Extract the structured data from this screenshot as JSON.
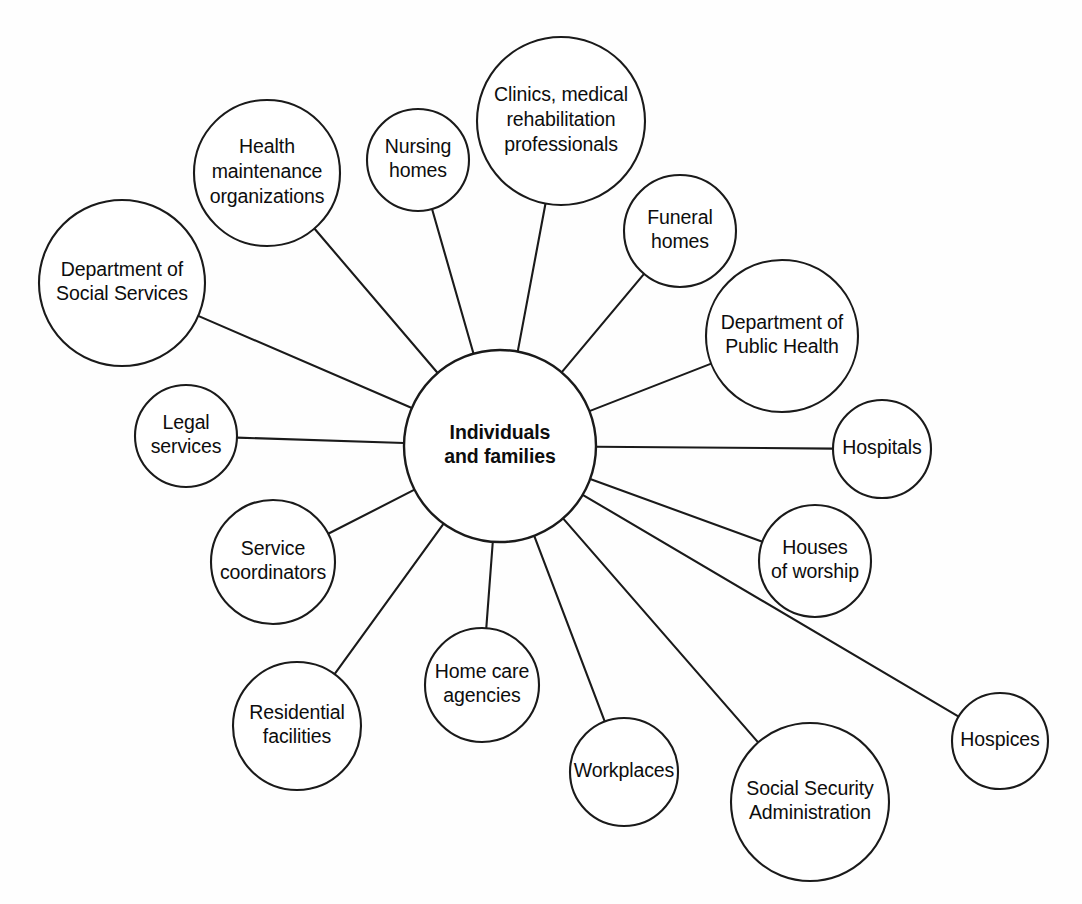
{
  "diagram": {
    "type": "hub-and-spoke network diagram",
    "background_color": "#fefefe",
    "stroke_color": "#1a1a1a",
    "text_color": "#0d0d0d",
    "center": {
      "id": "individuals-and-families",
      "lines": [
        "Individuals",
        "and families"
      ],
      "bold": true,
      "cx": 500,
      "cy": 446,
      "r": 96
    },
    "nodes": [
      {
        "id": "department-of-social-services",
        "lines": [
          "Department of",
          "Social Services"
        ],
        "cx": 122,
        "cy": 283,
        "r": 83,
        "font_size": 19.5
      },
      {
        "id": "health-maintenance-organizations",
        "lines": [
          "Health",
          "maintenance",
          "organizations"
        ],
        "cx": 267,
        "cy": 173,
        "r": 73,
        "font_size": 19.5
      },
      {
        "id": "nursing-homes",
        "lines": [
          "Nursing",
          "homes"
        ],
        "cx": 418,
        "cy": 160,
        "r": 51,
        "font_size": 19.5
      },
      {
        "id": "clinics-medical-rehabilitation-professionals",
        "lines": [
          "Clinics, medical",
          "rehabilitation",
          "professionals"
        ],
        "cx": 561,
        "cy": 121,
        "r": 84,
        "font_size": 19.5
      },
      {
        "id": "funeral-homes",
        "lines": [
          "Funeral",
          "homes"
        ],
        "cx": 680,
        "cy": 231,
        "r": 56,
        "font_size": 19.5
      },
      {
        "id": "department-of-public-health",
        "lines": [
          "Department of",
          "Public Health"
        ],
        "cx": 782,
        "cy": 336,
        "r": 76,
        "font_size": 19.5
      },
      {
        "id": "hospitals",
        "lines": [
          "Hospitals"
        ],
        "cx": 882,
        "cy": 449,
        "r": 49,
        "font_size": 19.5
      },
      {
        "id": "houses-of-worship",
        "lines": [
          "Houses",
          "of worship"
        ],
        "cx": 815,
        "cy": 561,
        "r": 56,
        "font_size": 19.5
      },
      {
        "id": "hospices",
        "lines": [
          "Hospices"
        ],
        "cx": 1000,
        "cy": 741,
        "r": 48,
        "font_size": 19.5
      },
      {
        "id": "social-security-administration",
        "lines": [
          "Social Security",
          "Administration"
        ],
        "cx": 810,
        "cy": 802,
        "r": 79,
        "font_size": 19.5
      },
      {
        "id": "workplaces",
        "lines": [
          "Workplaces"
        ],
        "cx": 624,
        "cy": 772,
        "r": 54,
        "font_size": 19.5
      },
      {
        "id": "home-care-agencies",
        "lines": [
          "Home care",
          "agencies"
        ],
        "cx": 482,
        "cy": 685,
        "r": 57,
        "font_size": 19.5
      },
      {
        "id": "residential-facilities",
        "lines": [
          "Residential",
          "facilities"
        ],
        "cx": 297,
        "cy": 726,
        "r": 64,
        "font_size": 19.5
      },
      {
        "id": "service-coordinators",
        "lines": [
          "Service",
          "coordinators"
        ],
        "cx": 273,
        "cy": 562,
        "r": 62,
        "font_size": 19.5
      },
      {
        "id": "legal-services",
        "lines": [
          "Legal",
          "services"
        ],
        "cx": 186,
        "cy": 436,
        "r": 51,
        "font_size": 19.5
      }
    ],
    "edges": [
      {
        "from": "individuals-and-families",
        "to": "department-of-social-services"
      },
      {
        "from": "individuals-and-families",
        "to": "health-maintenance-organizations"
      },
      {
        "from": "individuals-and-families",
        "to": "nursing-homes"
      },
      {
        "from": "individuals-and-families",
        "to": "clinics-medical-rehabilitation-professionals"
      },
      {
        "from": "individuals-and-families",
        "to": "funeral-homes"
      },
      {
        "from": "individuals-and-families",
        "to": "department-of-public-health"
      },
      {
        "from": "individuals-and-families",
        "to": "hospitals"
      },
      {
        "from": "individuals-and-families",
        "to": "houses-of-worship"
      },
      {
        "from": "individuals-and-families",
        "to": "hospices"
      },
      {
        "from": "individuals-and-families",
        "to": "social-security-administration"
      },
      {
        "from": "individuals-and-families",
        "to": "workplaces"
      },
      {
        "from": "individuals-and-families",
        "to": "home-care-agencies"
      },
      {
        "from": "individuals-and-families",
        "to": "residential-facilities"
      },
      {
        "from": "individuals-and-families",
        "to": "service-coordinators"
      },
      {
        "from": "individuals-and-families",
        "to": "legal-services"
      }
    ]
  }
}
